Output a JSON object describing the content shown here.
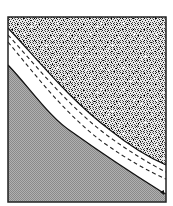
{
  "diagram": {
    "type": "cross-section schematic",
    "frame": {
      "x": 8,
      "y": 17,
      "width": 158,
      "height": 185,
      "stroke": "#222222"
    },
    "regions": [
      {
        "name": "upper-stippled-region",
        "fill": "stipple",
        "color_dark": "#2a2a2a",
        "color_light": "#f2f2f2"
      },
      {
        "name": "middle-white-band",
        "fill": "#ffffff"
      },
      {
        "name": "lower-gray-region",
        "fill": "fine-hatch",
        "color": "#9a9a9a"
      }
    ],
    "lines": [
      {
        "name": "upper-band-boundary",
        "style": "solid"
      },
      {
        "name": "dashed-line-1",
        "style": "dashed"
      },
      {
        "name": "dashed-line-2",
        "style": "dashed"
      },
      {
        "name": "lower-band-boundary",
        "style": "solid"
      }
    ],
    "labels": []
  }
}
